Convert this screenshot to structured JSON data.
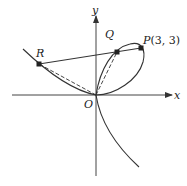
{
  "diagram": {
    "axes": {
      "x_label": "x",
      "y_label": "y",
      "origin_label": "O"
    },
    "points": [
      {
        "id": "P",
        "label": "P",
        "coords_text": "(3, 3)"
      },
      {
        "id": "Q",
        "label": "Q"
      },
      {
        "id": "R",
        "label": "R"
      }
    ],
    "segments": [
      {
        "from": "R",
        "to": "P",
        "style": "solid"
      },
      {
        "from": "O",
        "to": "R",
        "style": "dashed"
      },
      {
        "from": "O",
        "to": "Q",
        "style": "dashed"
      }
    ],
    "curve": "folium x^3 + y^3 = 6xy",
    "colors": {
      "stroke": "#333333",
      "background": "#ffffff"
    }
  }
}
